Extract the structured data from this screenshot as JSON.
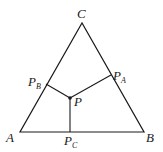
{
  "diagram": {
    "type": "geometry",
    "vertices": {
      "A": {
        "label": "A"
      },
      "B": {
        "label": "B"
      },
      "C": {
        "label": "C"
      }
    },
    "interior_point": {
      "label": "P"
    },
    "feet": {
      "PA": {
        "main": "P",
        "sub": "A"
      },
      "PB": {
        "main": "P",
        "sub": "B"
      },
      "PC": {
        "main": "P",
        "sub": "C"
      }
    },
    "colors": {
      "stroke": "#1a1a1a",
      "background": "#ffffff"
    }
  }
}
